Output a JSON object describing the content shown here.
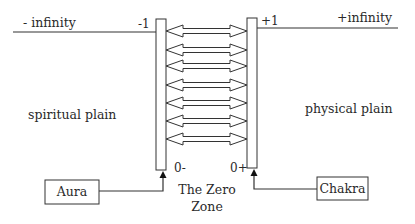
{
  "diagram": {
    "left_axis_label": "- infinity",
    "right_axis_label": "+infinity",
    "left_bar_top_label": "-1",
    "right_bar_top_label": "+1",
    "left_bar_bottom_label": "0-",
    "right_bar_bottom_label": "0+",
    "left_region_label": "spiritual plain",
    "right_region_label": "physical plain",
    "center_label_line1": "The Zero",
    "center_label_line2": "Zone",
    "left_box_label": "Aura",
    "right_box_label": "Chakra",
    "double_arrow_count": 7,
    "stroke_color": "#333333"
  }
}
